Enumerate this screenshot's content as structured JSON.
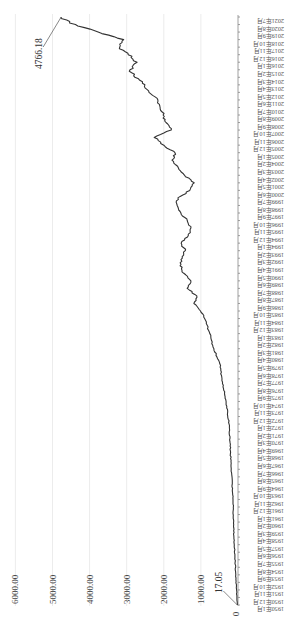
{
  "chart_data": {
    "type": "line",
    "title": "",
    "xlabel": "",
    "ylabel": "",
    "orientation": "rotated-90-clockwise",
    "ylim": [
      0,
      6000
    ],
    "grid": true,
    "legend": "none",
    "y_ticks": [
      "0",
      "1000.00",
      "2000.00",
      "3000.00",
      "4000.00",
      "5000.00",
      "6000.00"
    ],
    "x_tick_labels": [
      "1950年1月",
      "1950年12月",
      "1951年11月",
      "1952年10月",
      "1953年9月",
      "1954年8月",
      "1955年7月",
      "1956年6月",
      "1957年5月",
      "1958年4月",
      "1959年3月",
      "1960年2月",
      "1961年1月",
      "1961年12月",
      "1962年11月",
      "1963年10月",
      "1964年9月",
      "1965年8月",
      "1966年7月",
      "1967年6月",
      "1968年5月",
      "1969年4月",
      "1970年3月",
      "1971年2月",
      "1972年1月",
      "1972年12月",
      "1973年11月",
      "1974年10月",
      "1975年9月",
      "1976年8月",
      "1977年7月",
      "1978年6月",
      "1979年5月",
      "1980年4月",
      "1981年3月",
      "1982年2月",
      "1983年1月",
      "1983年12月",
      "1984年11月",
      "1985年10月",
      "1986年9月",
      "1987年8月",
      "1988年7月",
      "1989年6月",
      "1990年5月",
      "1991年4月",
      "1992年3月",
      "1993年2月",
      "1994年1月",
      "1994年12月",
      "1995年11月",
      "1996年10月",
      "1997年9月",
      "1998年8月",
      "1999年7月",
      "2000年6月",
      "2001年5月",
      "2002年4月",
      "2003年3月",
      "2004年2月",
      "2005年1月",
      "2005年12月",
      "2006年11月",
      "2007年10月",
      "2008年9月",
      "2009年8月",
      "2010年7月",
      "2011年6月",
      "2012年5月",
      "2013年4月",
      "2014年3月",
      "2015年2月",
      "2016年1月",
      "2016年12月",
      "2017年11月",
      "2018年10月",
      "2019年9月",
      "2020年8月",
      "2021年7月"
    ],
    "annotations": [
      {
        "label": "17.05",
        "at": "1950年1月",
        "value": 17.05
      },
      {
        "label": "4766.18",
        "at": "2021年7月",
        "value": 4766.18
      }
    ],
    "series": [
      {
        "name": "series-1",
        "x": [
          "1950年1月",
          "1953年9月",
          "1958年4月",
          "1962年11月",
          "1967年6月",
          "1972年1月",
          "1974年10月",
          "1977年7月",
          "1979年5月",
          "1981年3月",
          "1983年1月",
          "1984年11月",
          "1985年10月",
          "1986年9月",
          "1987年8月",
          "1988年7月",
          "1989年6月",
          "1990年5月",
          "1991年4月",
          "1992年3月",
          "1993年2月",
          "1994年1月",
          "1994年12月",
          "1995年11月",
          "1996年10月",
          "1997年9月",
          "1998年8月",
          "1999年7月",
          "2000年6月",
          "2001年5月",
          "2002年4月",
          "2003年3月",
          "2004年2月",
          "2005年1月",
          "2005年12月",
          "2006年11月",
          "2007年10月",
          "2008年9月",
          "2009年8月",
          "2010年7月",
          "2011年6月",
          "2012年5月",
          "2013年4月",
          "2014年3月",
          "2015年2月",
          "2016年1月",
          "2016年12月",
          "2017年11月",
          "2018年10月",
          "2019年9月",
          "2020年8月",
          "2021年7月"
        ],
        "values": [
          17.05,
          60,
          110,
          135,
          190,
          240,
          320,
          430,
          490,
          650,
          760,
          900,
          1010,
          1190,
          1110,
          1370,
          1270,
          1460,
          1560,
          1500,
          1420,
          1530,
          1340,
          1270,
          1370,
          1540,
          1640,
          1620,
          1300,
          1180,
          1440,
          1610,
          1780,
          1700,
          2000,
          2260,
          1800,
          1940,
          2020,
          2100,
          2160,
          2400,
          2510,
          2780,
          2910,
          2720,
          2960,
          3190,
          3080,
          3770,
          4380,
          4766.18
        ]
      }
    ]
  }
}
